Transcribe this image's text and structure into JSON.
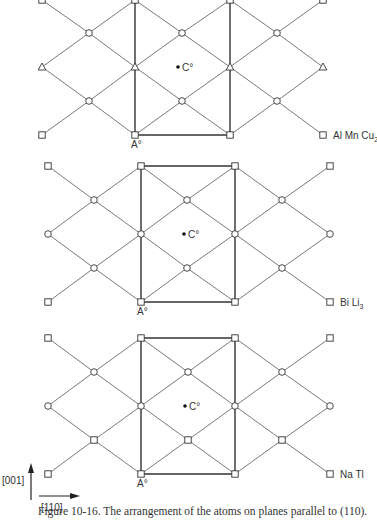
{
  "figure": {
    "caption": "Figure 10-16. The arrangement of the atoms on planes parallel to (110).",
    "axes": {
      "vertical_label": "[001]",
      "horizontal_label": "[110]"
    },
    "colors": {
      "line": "#555555",
      "thick_line": "#333333",
      "text": "#333333"
    },
    "panels": [
      {
        "name": "AlMnCu2",
        "compound_label": "Al Mn Cu",
        "compound_subscript": "2",
        "origin_label": "A°",
        "center_label": "C°",
        "columns": [
          42,
          89,
          135,
          182,
          230,
          277,
          323
        ],
        "rows": [
          0,
          33,
          67,
          101,
          135
        ],
        "cell": {
          "left": 135,
          "right": 230,
          "top": 0,
          "bottom": 135,
          "draw_top": false
        },
        "center_point": [
          182,
          67
        ],
        "nodes": [
          [
            "square",
            42,
            0
          ],
          [
            "square",
            135,
            0
          ],
          [
            "square",
            230,
            0
          ],
          [
            "square",
            323,
            0
          ],
          [
            "circle",
            89,
            33
          ],
          [
            "circle",
            182,
            33
          ],
          [
            "circle",
            277,
            33
          ],
          [
            "triangle",
            42,
            67
          ],
          [
            "triangle",
            135,
            67
          ],
          [
            "triangle",
            230,
            67
          ],
          [
            "triangle",
            323,
            67
          ],
          [
            "circle",
            89,
            101
          ],
          [
            "circle",
            182,
            101
          ],
          [
            "circle",
            277,
            101
          ],
          [
            "square",
            42,
            135
          ],
          [
            "square",
            135,
            135
          ],
          [
            "square",
            230,
            135
          ],
          [
            "square",
            323,
            135
          ]
        ]
      },
      {
        "name": "BiLi3",
        "compound_label": "Bi Li",
        "compound_subscript": "3",
        "origin_label": "A°",
        "center_label": "C°",
        "columns": [
          48,
          94,
          141,
          187,
          235,
          282,
          330
        ],
        "rows": [
          166,
          200,
          234,
          268,
          302
        ],
        "cell": {
          "left": 141,
          "right": 235,
          "top": 166,
          "bottom": 302,
          "draw_top": true
        },
        "center_point": [
          188,
          234
        ],
        "nodes": [
          [
            "square",
            48,
            166
          ],
          [
            "square",
            141,
            166
          ],
          [
            "square",
            235,
            166
          ],
          [
            "square",
            330,
            166
          ],
          [
            "circle",
            94,
            200
          ],
          [
            "circle",
            187,
            200
          ],
          [
            "circle",
            282,
            200
          ],
          [
            "circle",
            48,
            234
          ],
          [
            "circle",
            141,
            234
          ],
          [
            "circle",
            235,
            234
          ],
          [
            "circle",
            330,
            234
          ],
          [
            "circle",
            94,
            268
          ],
          [
            "circle",
            187,
            268
          ],
          [
            "circle",
            282,
            268
          ],
          [
            "square",
            48,
            302
          ],
          [
            "square",
            141,
            302
          ],
          [
            "square",
            235,
            302
          ],
          [
            "square",
            330,
            302
          ]
        ]
      },
      {
        "name": "NaTl",
        "compound_label": "Na Tl",
        "compound_subscript": "",
        "origin_label": "A°",
        "center_label": "C°",
        "columns": [
          48,
          94,
          141,
          188,
          235,
          282,
          330
        ],
        "rows": [
          338,
          372,
          406,
          440,
          474
        ],
        "cell": {
          "left": 141,
          "right": 235,
          "top": 338,
          "bottom": 474,
          "draw_top": true
        },
        "center_point": [
          189,
          406
        ],
        "nodes": [
          [
            "square",
            48,
            338
          ],
          [
            "square",
            141,
            338
          ],
          [
            "square",
            235,
            338
          ],
          [
            "square",
            330,
            338
          ],
          [
            "circle",
            94,
            372
          ],
          [
            "circle",
            188,
            372
          ],
          [
            "circle",
            282,
            372
          ],
          [
            "circle",
            48,
            406
          ],
          [
            "circle",
            141,
            406
          ],
          [
            "circle",
            235,
            406
          ],
          [
            "circle",
            330,
            406
          ],
          [
            "square",
            94,
            440
          ],
          [
            "square",
            188,
            440
          ],
          [
            "square",
            282,
            440
          ],
          [
            "square",
            48,
            474
          ],
          [
            "square",
            141,
            474
          ],
          [
            "square",
            235,
            474
          ],
          [
            "square",
            330,
            474
          ]
        ]
      }
    ]
  }
}
